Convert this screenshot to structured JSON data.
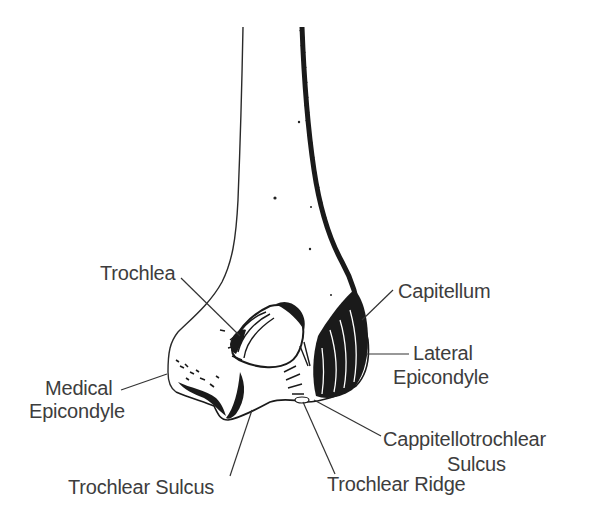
{
  "figure": {
    "labels": {
      "trochlea": "Trochlea",
      "capitellum": "Capitellum",
      "lateral_epicondyle_line1": "Lateral",
      "lateral_epicondyle_line2": "Epicondyle",
      "medial_epicondyle_line1": "Medical",
      "medial_epicondyle_line2": "Epicondyle",
      "capitellotrochlear_sulcus_line1": "Cappitellotrochlear",
      "capitellotrochlear_sulcus_line2": "Sulcus",
      "trochlear_sulcus": "Trochlear Sulcus",
      "trochlear_ridge": "Trochlear Ridge"
    },
    "caption_partial": ""
  },
  "colors": {
    "ink": "#1a1a1a",
    "label_text": "#3d3d3d",
    "background": "#ffffff"
  }
}
